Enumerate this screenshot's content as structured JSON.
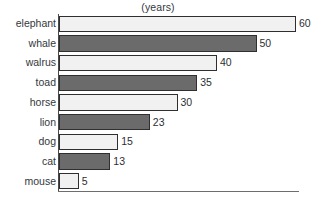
{
  "chart_data": {
    "type": "bar",
    "orientation": "horizontal",
    "title": "(years)",
    "xlabel": "",
    "ylabel": "",
    "grid": false,
    "legend": null,
    "xlim": [
      0,
      60
    ],
    "categories": [
      "elephant",
      "whale",
      "walrus",
      "toad",
      "horse",
      "lion",
      "dog",
      "cat",
      "mouse"
    ],
    "values": [
      60,
      50,
      40,
      35,
      30,
      23,
      15,
      13,
      5
    ],
    "data_labels": [
      "60",
      "50",
      "40",
      "35",
      "30",
      "23",
      "15",
      "13",
      "5"
    ],
    "bar_fills": [
      "light",
      "dark",
      "light",
      "dark",
      "light",
      "dark",
      "light",
      "dark",
      "light"
    ],
    "colors": {
      "light_fill": "#f1f1f1",
      "dark_fill": "#6b6b6b",
      "bar_border": "#2f2f2f",
      "axis": "#4a4a4a",
      "text": "#33383d",
      "background": "#ffffff"
    }
  }
}
